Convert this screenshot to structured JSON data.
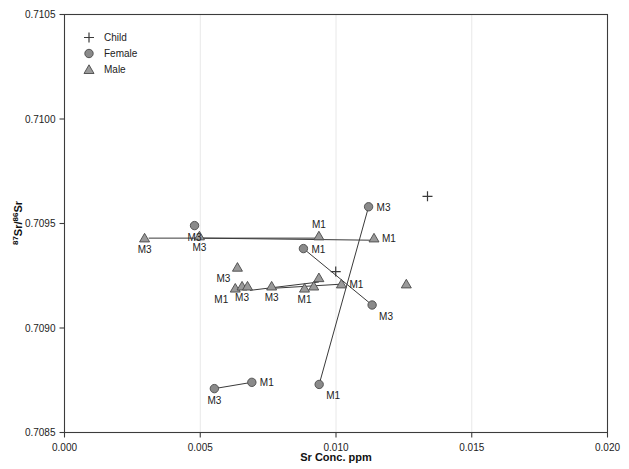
{
  "chart_data": {
    "type": "scatter",
    "title": "",
    "xlabel": "Sr Conc. ppm",
    "ylabel": "87Sr/86Sr",
    "ylabel_display": "⁸⁷Sr/⁸⁶Sr",
    "xlim": [
      0.0,
      0.02
    ],
    "ylim": [
      0.7085,
      0.7105
    ],
    "xticks": [
      "0.000",
      "0.005",
      "0.010",
      "0.015",
      "0.020"
    ],
    "xtick_values": [
      0.0,
      0.005,
      0.01,
      0.015,
      0.02
    ],
    "yticks": [
      "0.7085",
      "0.7090",
      "0.7095",
      "0.7100",
      "0.7105"
    ],
    "ytick_values": [
      0.7085,
      0.709,
      0.7095,
      0.71,
      0.7105
    ],
    "grid": "vertical-faint",
    "legend_position": "top-left",
    "legend": [
      {
        "label": "Child",
        "marker": "plus-marker"
      },
      {
        "label": "Female",
        "marker": "circle-marker"
      },
      {
        "label": "Male",
        "marker": "triangle-marker"
      }
    ],
    "series": [
      {
        "name": "Child",
        "marker": "plus",
        "points": [
          {
            "x": 0.01337,
            "y": 0.70963,
            "label": ""
          },
          {
            "x": 0.00999,
            "y": 0.70927,
            "label": ""
          }
        ]
      },
      {
        "name": "Female",
        "marker": "circle",
        "points": [
          {
            "x": 0.00479,
            "y": 0.70949,
            "label": "M3",
            "label_pos": "below"
          },
          {
            "x": 0.0088,
            "y": 0.70938,
            "label": "M1",
            "label_pos": "right"
          },
          {
            "x": 0.0112,
            "y": 0.70958,
            "label": "M3",
            "label_pos": "right"
          },
          {
            "x": 0.01133,
            "y": 0.70911,
            "label": "M3",
            "label_pos": "below-right"
          },
          {
            "x": 0.00552,
            "y": 0.70871,
            "label": "M3",
            "label_pos": "below"
          },
          {
            "x": 0.0069,
            "y": 0.70874,
            "label": "M1",
            "label_pos": "right"
          },
          {
            "x": 0.00938,
            "y": 0.70873,
            "label": "M1",
            "label_pos": "below-right"
          }
        ]
      },
      {
        "name": "Male",
        "marker": "triangle",
        "points": [
          {
            "x": 0.00295,
            "y": 0.70943,
            "label": "M3",
            "label_pos": "below"
          },
          {
            "x": 0.00497,
            "y": 0.70944,
            "label": "M3",
            "label_pos": "below"
          },
          {
            "x": 0.00937,
            "y": 0.70944,
            "label": "M1",
            "label_pos": "above"
          },
          {
            "x": 0.0114,
            "y": 0.70943,
            "label": "M1",
            "label_pos": "right"
          },
          {
            "x": 0.00637,
            "y": 0.70929,
            "label": "M3",
            "label_pos": "below-left"
          },
          {
            "x": 0.00629,
            "y": 0.70919,
            "label": "M1",
            "label_pos": "below-left"
          },
          {
            "x": 0.00654,
            "y": 0.7092,
            "label": "M3",
            "label_pos": "below"
          },
          {
            "x": 0.00674,
            "y": 0.7092,
            "label": "",
            "label_pos": "below"
          },
          {
            "x": 0.00763,
            "y": 0.7092,
            "label": "M3",
            "label_pos": "below"
          },
          {
            "x": 0.00884,
            "y": 0.70919,
            "label": "M1",
            "label_pos": "below"
          },
          {
            "x": 0.00918,
            "y": 0.7092,
            "label": "",
            "label_pos": "below"
          },
          {
            "x": 0.00937,
            "y": 0.70924,
            "label": "",
            "label_pos": "above"
          },
          {
            "x": 0.0102,
            "y": 0.70921,
            "label": "M1",
            "label_pos": "right"
          },
          {
            "x": 0.01259,
            "y": 0.70921,
            "label": "",
            "label_pos": "right"
          }
        ]
      }
    ],
    "connectors": [
      {
        "from": [
          0.0031,
          0.70943
        ],
        "to": [
          0.00937,
          0.70943
        ]
      },
      {
        "from": [
          0.00504,
          0.70943
        ],
        "to": [
          0.0114,
          0.70942
        ]
      },
      {
        "from": [
          0.00683,
          0.70918
        ],
        "to": [
          0.00937,
          0.70922
        ]
      },
      {
        "from": [
          0.00768,
          0.70919
        ],
        "to": [
          0.01022,
          0.70921
        ]
      },
      {
        "from": [
          0.00552,
          0.70871
        ],
        "to": [
          0.0069,
          0.70874
        ]
      },
      {
        "from": [
          0.0088,
          0.70938
        ],
        "to": [
          0.01133,
          0.70911
        ]
      },
      {
        "from": [
          0.0112,
          0.70958
        ],
        "to": [
          0.00938,
          0.70873
        ]
      }
    ]
  }
}
